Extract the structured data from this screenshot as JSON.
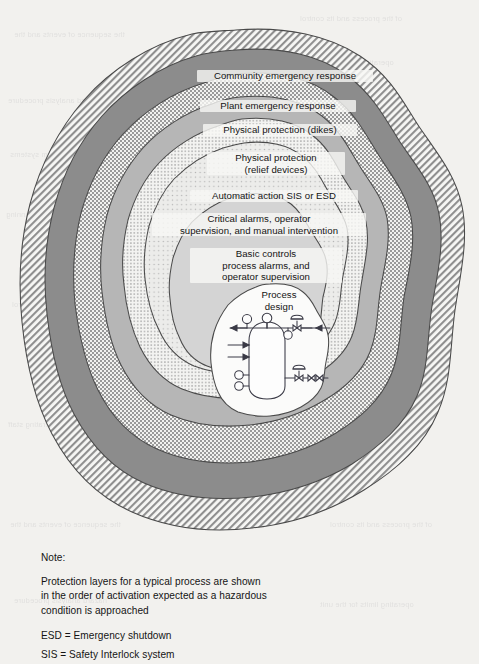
{
  "figure": {
    "title": "Protection layers for a typical process",
    "layers": [
      {
        "id": "community-emergency-response",
        "label": "Community emergency response",
        "pattern": "diagonal-hatch",
        "order": 8
      },
      {
        "id": "plant-emergency-response",
        "label": "Plant emergency response",
        "pattern": "solid-dark-gray",
        "order": 7
      },
      {
        "id": "physical-protection-dikes",
        "label": "Physical protection (dikes)",
        "pattern": "checkerboard",
        "order": 6
      },
      {
        "id": "physical-protection-relief",
        "label": "Physical protection\n(relief devices)",
        "pattern": "solid-mid-gray",
        "order": 5
      },
      {
        "id": "automatic-action-sis-esd",
        "label": "Automatic action SIS or ESD",
        "pattern": "fine-dots",
        "order": 4
      },
      {
        "id": "critical-alarms",
        "label": "Critical alarms, operator\nsupervision, and manual intervention",
        "pattern": "sparse-dots",
        "order": 3
      },
      {
        "id": "basic-controls",
        "label": "Basic controls\nprocess alarms, and\noperator supervision",
        "pattern": "light-gray",
        "order": 2
      },
      {
        "id": "process-design",
        "label": "Process\ndesign",
        "pattern": "white",
        "order": 1
      }
    ],
    "process_sketch": {
      "name": "process-vessel-schematic",
      "elements": [
        "vertical-vessel",
        "instrument-bubble-top-left",
        "instrument-bubble-top-center",
        "instrument-bubble-top-right",
        "instrument-bubble-left-upper",
        "instrument-bubble-left-lower",
        "control-valve-top",
        "control-valve-bottom",
        "gate-valve-bottom",
        "outlet-arrow-left",
        "inlet-arrow-upper",
        "inlet-arrow-lower",
        "inlet-arrow-right"
      ]
    }
  },
  "notes": {
    "heading": "Note:",
    "body": "Protection layers for a typical process are shown\nin the order of activation expected as a hazardous\ncondition is approached",
    "abbreviations": [
      "ESD = Emergency shutdown",
      "SIS = Safety Interlock system"
    ]
  },
  "bleedthrough": {
    "lines": [
      "the sequence of events and the",
      "of the process and its control",
      "hazard analysis procedure",
      "operating limits for the unit",
      "interlock and alarm systems",
      "relief device capacity check",
      "emergency response planning",
      "documentation of the review",
      "management of change control",
      "periodic audit of compliance",
      "training of operating staff",
      "risk assessment worksheet"
    ]
  },
  "colors": {
    "page_background": "#f2f1ee",
    "ink": "#141414",
    "layer_dark_gray": "#8c8c8c",
    "layer_mid_gray": "#b3b3b3",
    "layer_light_gray": "#cfcfcf",
    "layer_pale_gray": "#e2e2e2",
    "outline": "#4a4a4a"
  }
}
